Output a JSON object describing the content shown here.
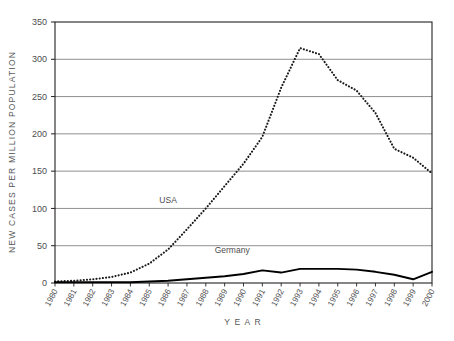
{
  "chart_data": {
    "type": "line",
    "title": "",
    "xlabel": "Y E A R",
    "ylabel": "NEW CASES PER MILLION POPULATION",
    "xlim": [
      1980,
      2000
    ],
    "ylim": [
      0,
      350
    ],
    "ytick_step": 50,
    "yticks": [
      0,
      50,
      100,
      150,
      200,
      250,
      300,
      350
    ],
    "ytick_labels": [
      "0",
      "50",
      "100",
      "150",
      "200",
      "250",
      "300",
      "350"
    ],
    "grid": "horizontal",
    "legend_position": "inline-annotations",
    "x": [
      1980,
      1981,
      1982,
      1983,
      1984,
      1985,
      1986,
      1987,
      1988,
      1989,
      1990,
      1991,
      1992,
      1993,
      1994,
      1995,
      1996,
      1997,
      1998,
      1999,
      2000
    ],
    "categories": [
      "1980",
      "1981",
      "1982",
      "1983",
      "1984",
      "1985",
      "1986",
      "1987",
      "1988",
      "1989",
      "1990",
      "1991",
      "1992",
      "1993",
      "1994",
      "1995",
      "1996",
      "1997",
      "1998",
      "1999",
      "2000"
    ],
    "series": [
      {
        "name": "USA",
        "style": "dotted",
        "color": "#1a1a1a",
        "values": [
          2,
          3,
          5,
          8,
          14,
          26,
          45,
          72,
          100,
          130,
          160,
          196,
          262,
          315,
          307,
          272,
          258,
          228,
          180,
          168,
          147
        ]
      },
      {
        "name": "Germany",
        "style": "solid",
        "color": "#000000",
        "values": [
          1,
          1,
          1,
          1,
          1,
          2,
          3,
          5,
          7,
          9,
          12,
          17,
          14,
          19,
          19,
          19,
          18,
          15,
          11,
          5,
          15
        ]
      }
    ],
    "annotations": [
      {
        "text": "USA",
        "x": 1986,
        "y": 107
      },
      {
        "text": "Germany",
        "x": 1989.4,
        "y": 40
      }
    ]
  },
  "colors": {
    "frame": "#231f20",
    "gridline": "#808285",
    "text": "#4d4d4f",
    "usa_line": "#1a1a1a",
    "germany_line": "#000000",
    "background": "#ffffff"
  }
}
